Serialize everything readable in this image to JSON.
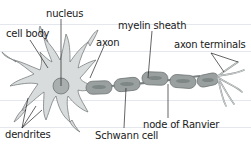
{
  "diagram": {
    "labels": {
      "nucleus": "nucleus",
      "cell_body": "cell body",
      "axon": "axon",
      "myelin_sheath": "myelin sheath",
      "axon_terminals": "axon terminals",
      "dendrites": "dendrites",
      "schwann_cell": "Schwann cell",
      "node_of_ranvier": "node of Ranvier"
    },
    "colors": {
      "cell_fill": "#d9dcdc",
      "cell_stroke": "#7a7f80",
      "myelin_fill": "#9aa0a0",
      "myelin_core": "#7e8686",
      "nucleus_fill": "#a9afaf",
      "leader_line": "#222222",
      "rule_line": "#e4e8ee"
    }
  }
}
